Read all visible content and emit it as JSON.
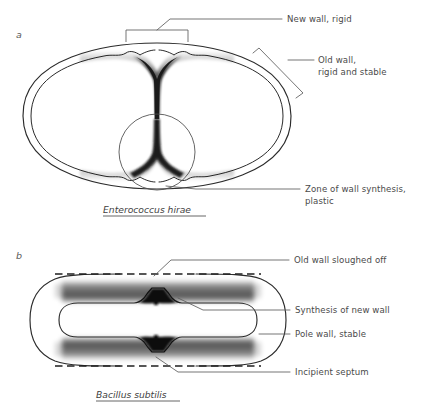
{
  "figure": {
    "background": "#ffffff",
    "ink_color": "#2b2b2b",
    "leader_color": "#5c5c5c"
  },
  "panels": [
    {
      "id": "a",
      "panel_label": "a",
      "species": "Enterococcus hirae",
      "labels": [
        {
          "name": "new-wall-rigid",
          "text": "New wall, rigid"
        },
        {
          "name": "old-wall-rigid-stable",
          "line1": "Old wall,",
          "line2": "rigid and stable"
        },
        {
          "name": "zone-of-wall-synthesis",
          "line1": "Zone of wall synthesis,",
          "line2": "plastic"
        }
      ]
    },
    {
      "id": "b",
      "panel_label": "b",
      "species": "Bacillus subtilis",
      "labels": [
        {
          "name": "old-wall-sloughed-off",
          "text": "Old wall sloughed off"
        },
        {
          "name": "synthesis-of-new-wall",
          "text": "Synthesis of new wall"
        },
        {
          "name": "pole-wall-stable",
          "text": "Pole wall, stable"
        },
        {
          "name": "incipient-septum",
          "text": "Incipient septum"
        }
      ]
    }
  ]
}
